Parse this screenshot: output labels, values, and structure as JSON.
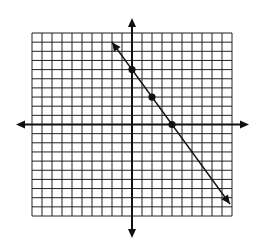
{
  "chart_data": {
    "type": "line",
    "title": "",
    "xlabel": "",
    "ylabel": "",
    "xlim": [
      -10,
      10
    ],
    "ylim": [
      -10,
      10
    ],
    "grid": true,
    "grid_step": 1,
    "axes_arrows": true,
    "line": {
      "equation": "y = -1.5x + 6",
      "slope": -1.5,
      "intercept": 6,
      "x_range": [
        -2,
        9.8
      ],
      "arrows_both_ends": true
    },
    "points": [
      {
        "x": 0,
        "y": 6
      },
      {
        "x": 2,
        "y": 3
      },
      {
        "x": 4,
        "y": 0
      }
    ],
    "colors": {
      "ink": "#111111",
      "grid": "#222222",
      "background": "#ffffff"
    }
  }
}
